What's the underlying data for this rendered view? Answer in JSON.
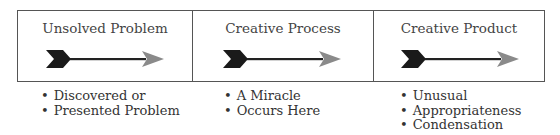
{
  "diagram": {
    "stages": [
      {
        "title": "Unsolved Problem",
        "bullets": [
          "Discovered or",
          "Presented Problem"
        ]
      },
      {
        "title": "Creative Process",
        "bullets": [
          "A Miracle",
          "Occurs Here"
        ]
      },
      {
        "title": "Creative Product",
        "bullets": [
          "Unusual",
          "Appropriateness",
          "Condensation"
        ]
      }
    ],
    "colors": {
      "fletching": "#1a1a1a",
      "shaft": "#222222",
      "arrowhead": "#8a8a8a",
      "border": "#555555"
    }
  }
}
